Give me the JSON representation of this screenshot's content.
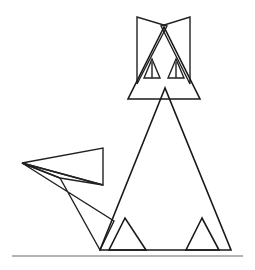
{
  "artwork": {
    "title": "Geometric Cat Line Drawing",
    "subject": "cat",
    "style": "triangle line art",
    "background_color": "#ffffff",
    "stroke_color": "#1a1a1a",
    "ground_color": "#9a9a9a",
    "canvas": {
      "width": 255,
      "height": 270
    }
  },
  "shapes": {
    "head": {
      "name": "head-triangle",
      "points": "164,27 128,99 200,99",
      "description": "Large triangle forming the cat head"
    },
    "ear_left": {
      "name": "left-ear",
      "points": "137,17 137,84 167,26",
      "description": "Left pointed ear formed by a narrow triangle"
    },
    "ear_right": {
      "name": "right-ear",
      "points": "190,17 190,84 161,26",
      "description": "Right pointed ear formed by a narrow triangle"
    },
    "eye_left": {
      "name": "left-eye-triangle",
      "points": "152,59 144,78 160,78",
      "description": "Small triangle left eye"
    },
    "eye_left_pupil": {
      "name": "left-eye-pupil",
      "points": "152,62 152,78",
      "description": "Vertical pupil line inside left eye"
    },
    "eye_right": {
      "name": "right-eye-triangle",
      "points": "176,59 168,78 184,78",
      "description": "Small triangle right eye"
    },
    "eye_right_pupil": {
      "name": "right-eye-pupil",
      "points": "176,62 176,78",
      "description": "Vertical pupil line inside right eye"
    },
    "body": {
      "name": "body-triangle",
      "points": "165,88 100,250 231,250",
      "description": "Large triangle forming the seated body"
    },
    "leg_left": {
      "name": "left-leg-triangle",
      "points": "125,218 109,250 146,250",
      "description": "Left front paw triangle"
    },
    "leg_right": {
      "name": "right-leg-triangle",
      "points": "202,218 186,250 219,250",
      "description": "Right front paw triangle"
    },
    "tail_upper": {
      "name": "tail-upper-spike",
      "points": "22,163 103,148 103,185",
      "description": "Upper thin spike of the tail"
    },
    "tail_mid": {
      "name": "tail-middle-sliver",
      "points": "22,163 103,185 60,178",
      "description": "Middle narrow sliver of the tail"
    },
    "tail_lower": {
      "name": "tail-lower-sweep",
      "points": "22,163 114,221 100,250 60,178",
      "description": "Lower sweeping wedge of the tail meeting the ground"
    },
    "ground_line": {
      "name": "ground-line",
      "points": "12,256 243,256",
      "description": "Horizontal grey ground line"
    }
  }
}
